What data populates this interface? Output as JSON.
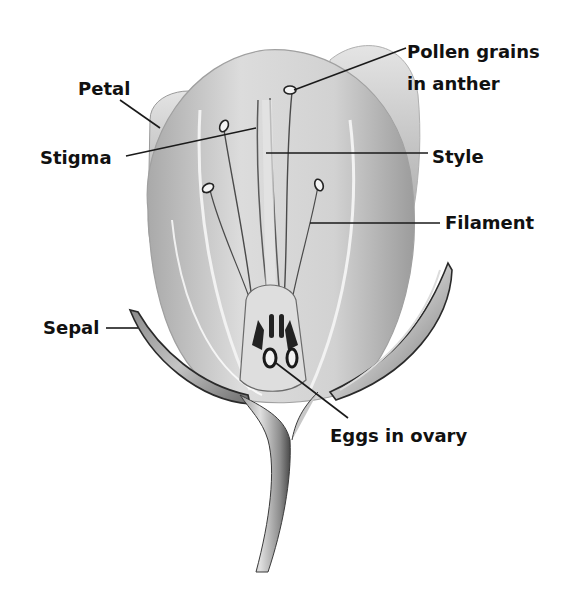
{
  "diagram": {
    "labels": [
      {
        "id": "petal",
        "text": "Petal",
        "x": 78,
        "y": 95,
        "anchor": "start",
        "line": [
          [
            120,
            100
          ],
          [
            160,
            128
          ]
        ]
      },
      {
        "id": "stigma",
        "text": "Stigma",
        "x": 40,
        "y": 164,
        "anchor": "start",
        "line": [
          [
            126,
            156
          ],
          [
            256,
            128
          ]
        ]
      },
      {
        "id": "pollen",
        "text": "Pollen grains",
        "x": 407,
        "y": 58,
        "anchor": "start",
        "text2": "in anther",
        "x2": 407,
        "y2": 90,
        "line": [
          [
            406,
            48
          ],
          [
            292,
            90
          ]
        ]
      },
      {
        "id": "style",
        "text": "Style",
        "x": 432,
        "y": 163,
        "anchor": "start",
        "line": [
          [
            428,
            153
          ],
          [
            266,
            153
          ]
        ]
      },
      {
        "id": "filament",
        "text": "Filament",
        "x": 445,
        "y": 229,
        "anchor": "start",
        "line": [
          [
            440,
            223
          ],
          [
            310,
            223
          ]
        ]
      },
      {
        "id": "sepal",
        "text": "Sepal",
        "x": 43,
        "y": 334,
        "anchor": "start",
        "line": [
          [
            106,
            328
          ],
          [
            138,
            328
          ]
        ]
      },
      {
        "id": "eggs",
        "text": "Eggs in ovary",
        "x": 330,
        "y": 442,
        "anchor": "start",
        "line": [
          [
            348,
            418
          ],
          [
            278,
            365
          ]
        ]
      }
    ],
    "colors": {
      "background": "#ffffff",
      "text": "#111111",
      "petal_light": "#d9d9d9",
      "petal_mid": "#b8b8b8",
      "petal_dark": "#7a7a7a",
      "outline": "#3a3a3a"
    }
  }
}
